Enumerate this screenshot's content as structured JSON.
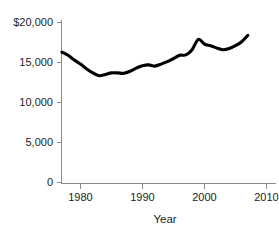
{
  "chart_data": {
    "type": "line",
    "title": "",
    "subtitle": "",
    "xlabel": "Year",
    "ylabel": "",
    "xlim": [
      1977,
      2010
    ],
    "ylim": [
      0,
      20000
    ],
    "grid": false,
    "legend": false,
    "legend_position": "none",
    "line_color": "#000000",
    "axis_color": "#8a8a8a",
    "text_color": "#1c1c1c",
    "background_color": "#ffffff",
    "xticks": [
      1980,
      1990,
      2000,
      2010
    ],
    "xtick_labels": [
      "1980",
      "1990",
      "2000",
      "2010"
    ],
    "yticks": [
      0,
      5000,
      10000,
      15000,
      20000
    ],
    "ytick_labels": [
      "0",
      "5,000",
      "10,000",
      "15,000",
      "$20,000"
    ],
    "series": [
      {
        "name": "value",
        "x": [
          1977,
          1978,
          1979,
          1980,
          1981,
          1982,
          1983,
          1984,
          1985,
          1986,
          1987,
          1988,
          1989,
          1990,
          1991,
          1992,
          1993,
          1994,
          1995,
          1996,
          1997,
          1998,
          1999,
          2000,
          2001,
          2002,
          2003,
          2004,
          2005,
          2006,
          2007
        ],
        "values": [
          16300,
          15900,
          15300,
          14800,
          14200,
          13700,
          13350,
          13500,
          13700,
          13700,
          13650,
          13900,
          14300,
          14600,
          14700,
          14550,
          14800,
          15100,
          15500,
          15900,
          15950,
          16600,
          17900,
          17300,
          17100,
          16800,
          16600,
          16750,
          17100,
          17600,
          18400
        ]
      }
    ]
  },
  "axis": {
    "x_title": "Year"
  }
}
